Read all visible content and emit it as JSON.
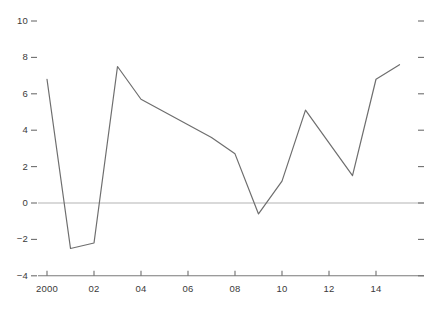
{
  "chart_data": {
    "type": "line",
    "title": "",
    "subtitle": "",
    "xlabel": "",
    "ylabel": "",
    "x": [
      2000,
      2001,
      2002,
      2003,
      2004,
      2005,
      2006,
      2007,
      2008,
      2009,
      2010,
      2011,
      2012,
      2013,
      2014,
      2015
    ],
    "values": [
      6.8,
      -2.5,
      -2.2,
      7.5,
      5.7,
      5.0,
      4.3,
      3.6,
      2.7,
      -0.6,
      1.2,
      5.1,
      3.3,
      1.5,
      6.8,
      7.6
    ],
    "series": [
      {
        "name": "",
        "values": [
          6.8,
          -2.5,
          -2.2,
          7.5,
          5.7,
          5.0,
          4.3,
          3.6,
          2.7,
          -0.6,
          1.2,
          5.1,
          3.3,
          1.5,
          6.8,
          7.6
        ]
      }
    ],
    "xlim": [
      2000,
      2015
    ],
    "ylim": [
      -4,
      10
    ],
    "ytick_values": [
      10,
      8,
      6,
      4,
      2,
      0,
      -2,
      -4
    ],
    "ytick_labels": [
      "10",
      "8",
      "6",
      "4",
      "2",
      "0",
      "−2",
      "−4"
    ],
    "xtick_values": [
      2000,
      2002,
      2004,
      2006,
      2008,
      2010,
      2012,
      2014
    ],
    "xtick_labels": [
      "2000",
      "02",
      "04",
      "06",
      "08",
      "10",
      "12",
      "14"
    ],
    "grid": false,
    "legend": "none",
    "zero_line": true,
    "right_ticks": true,
    "annotations": []
  },
  "style": {
    "line_color": "#6e6e6e",
    "axis_color": "#7a7a7a",
    "zero_line_color": "#b4b4b4",
    "tick_color": "#6e6e6e",
    "text_color": "#3a3a3a",
    "background": "#ffffff"
  }
}
